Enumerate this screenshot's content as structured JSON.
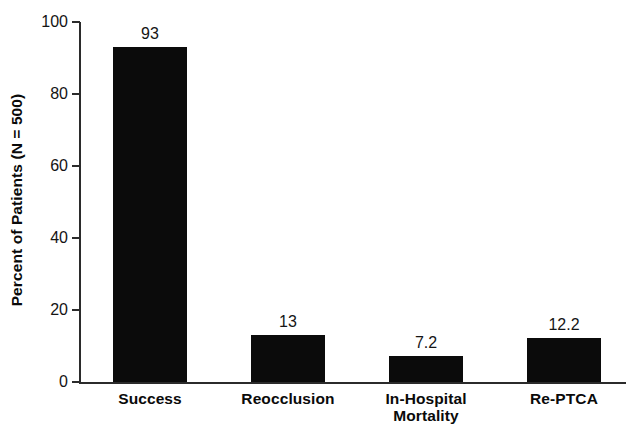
{
  "chart_data": {
    "type": "bar",
    "title": "",
    "subtitle": "",
    "xlabel": "",
    "ylabel": "Percent of Patients (N = 500)",
    "categories": [
      "Success",
      "Reocclusion",
      "In-Hospital\nMortality",
      "Re-PTCA"
    ],
    "values": [
      93,
      13,
      7.2,
      12.2
    ],
    "value_labels": [
      "93",
      "13",
      "7.2",
      "12.2"
    ],
    "ylim": [
      0,
      100
    ],
    "ytick_values": [
      0,
      20,
      40,
      60,
      80,
      100
    ],
    "ytick_labels": [
      "0",
      "20",
      "40",
      "60",
      "80",
      "100"
    ],
    "grid": false,
    "legend": false,
    "legend_position": "none",
    "bar_color": "#0b0b0b",
    "axis_color": "#2b2b2b",
    "background_color": "#ffffff"
  },
  "axis": {
    "y_title": "Percent of Patients (N = 500)"
  }
}
